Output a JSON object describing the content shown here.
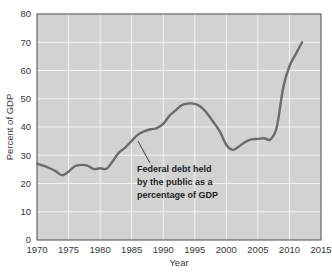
{
  "chart_data": {
    "type": "line",
    "title": "",
    "xlabel": "Year",
    "ylabel": "Percent of GDP",
    "xlim": [
      1970,
      2015
    ],
    "ylim": [
      0,
      80
    ],
    "grid": true,
    "legend_position": "none",
    "xticks": [
      "1970",
      "1975",
      "1980",
      "1985",
      "1990",
      "1995",
      "2000",
      "2005",
      "2010",
      "2015"
    ],
    "yticks": [
      "0",
      "10",
      "20",
      "30",
      "40",
      "50",
      "60",
      "70",
      "80"
    ],
    "annotations": [
      {
        "text_lines": [
          "Federal debt held",
          "by the public as a",
          "percentage of GDP"
        ],
        "points_to_year": 1986,
        "points_to_value": 35
      }
    ],
    "series": [
      {
        "name": "Federal debt held by the public as a percentage of GDP",
        "color": "#6b6b6b",
        "x": [
          1970,
          1971,
          1972,
          1973,
          1974,
          1975,
          1976,
          1977,
          1978,
          1979,
          1980,
          1981,
          1982,
          1983,
          1984,
          1985,
          1986,
          1987,
          1988,
          1989,
          1990,
          1991,
          1992,
          1993,
          1994,
          1995,
          1996,
          1997,
          1998,
          1999,
          2000,
          2001,
          2002,
          2003,
          2004,
          2005,
          2006,
          2007,
          2008,
          2009,
          2010,
          2011,
          2012
        ],
        "values": [
          27.0,
          26.3,
          25.4,
          24.3,
          22.9,
          24.2,
          26.1,
          26.6,
          26.3,
          25.1,
          25.4,
          25.2,
          27.9,
          31.0,
          32.8,
          35.1,
          37.3,
          38.5,
          39.2,
          39.6,
          41.1,
          44.0,
          46.0,
          47.8,
          48.3,
          48.2,
          47.1,
          44.7,
          41.6,
          38.3,
          33.7,
          31.9,
          33.1,
          34.7,
          35.6,
          35.8,
          36.0,
          35.6,
          40.0,
          53.8,
          61.5,
          65.8,
          70.0
        ]
      }
    ]
  }
}
